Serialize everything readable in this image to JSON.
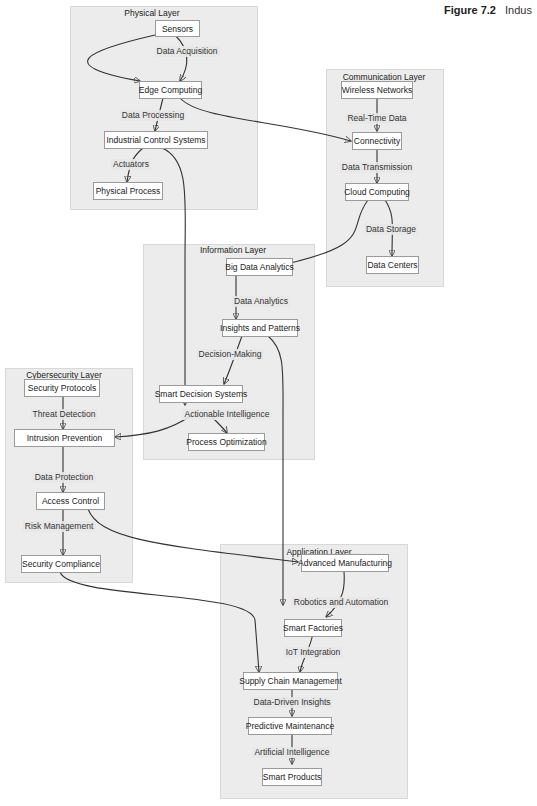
{
  "caption": {
    "figure": "Figure 7.2",
    "title": "Indus"
  },
  "clusters": {
    "physical": {
      "title": "Physical Layer"
    },
    "communication": {
      "title": "Communication Layer"
    },
    "information": {
      "title": "Information Layer"
    },
    "cybersecurity": {
      "title": "Cybersecurity Layer"
    },
    "application": {
      "title": "Application Layer"
    }
  },
  "nodes": {
    "sensors": "Sensors",
    "edge_computing": "Edge Computing",
    "industrial_control": "Industrial Control Systems",
    "physical_process": "Physical Process",
    "wireless_networks": "Wireless Networks",
    "connectivity": "Connectivity",
    "cloud_computing": "Cloud Computing",
    "data_centers": "Data Centers",
    "big_data": "Big Data Analytics",
    "insights": "Insights and Patterns",
    "smart_decision": "Smart Decision Systems",
    "process_optimization": "Process Optimization",
    "security_protocols": "Security Protocols",
    "intrusion_prevention": "Intrusion Prevention",
    "access_control": "Access Control",
    "security_compliance": "Security Compliance",
    "advanced_manufacturing": "Advanced Manufacturing",
    "smart_factories": "Smart Factories",
    "supply_chain": "Supply Chain Management",
    "predictive_maintenance": "Predictive Maintenance",
    "smart_products": "Smart Products"
  },
  "edge_labels": {
    "data_acquisition": "Data Acquisition",
    "data_processing": "Data Processing",
    "actuators": "Actuators",
    "real_time_data": "Real-Time Data",
    "data_transmission": "Data Transmission",
    "data_storage": "Data Storage",
    "data_analytics": "Data Analytics",
    "decision_making": "Decision-Making",
    "actionable_intelligence": "Actionable Intelligence",
    "threat_detection": "Threat Detection",
    "data_protection": "Data Protection",
    "risk_management": "Risk Management",
    "robotics_automation": "Robotics and Automation",
    "iot_integration": "IoT Integration",
    "data_driven_insights": "Data-Driven Insights",
    "artificial_intelligence": "Artificial Intelligence"
  },
  "edges": [
    [
      "Sensors",
      "Edge Computing",
      ""
    ],
    [
      "Sensors",
      "Edge Computing",
      "Data Acquisition"
    ],
    [
      "Edge Computing",
      "Industrial Control Systems",
      "Data Processing"
    ],
    [
      "Edge Computing",
      "Connectivity",
      ""
    ],
    [
      "Industrial Control Systems",
      "Physical Process",
      "Actuators"
    ],
    [
      "Industrial Control Systems",
      "Smart Decision Systems",
      ""
    ],
    [
      "Wireless Networks",
      "Connectivity",
      "Real-Time Data"
    ],
    [
      "Connectivity",
      "Cloud Computing",
      "Data Transmission"
    ],
    [
      "Cloud Computing",
      "Data Centers",
      "Data Storage"
    ],
    [
      "Cloud Computing",
      "Big Data Analytics",
      ""
    ],
    [
      "Big Data Analytics",
      "Insights and Patterns",
      "Data Analytics"
    ],
    [
      "Insights and Patterns",
      "Smart Decision Systems",
      "Decision-Making"
    ],
    [
      "Insights and Patterns",
      "Smart Factories",
      ""
    ],
    [
      "Smart Decision Systems",
      "Process Optimization",
      "Actionable Intelligence"
    ],
    [
      "Smart Decision Systems",
      "Intrusion Prevention",
      ""
    ],
    [
      "Security Protocols",
      "Intrusion Prevention",
      "Threat Detection"
    ],
    [
      "Intrusion Prevention",
      "Access Control",
      "Data Protection"
    ],
    [
      "Access Control",
      "Security Compliance",
      "Risk Management"
    ],
    [
      "Access Control",
      "Advanced Manufacturing",
      ""
    ],
    [
      "Security Compliance",
      "Supply Chain Management",
      ""
    ],
    [
      "Advanced Manufacturing",
      "Smart Factories",
      "Robotics and Automation"
    ],
    [
      "Smart Factories",
      "Supply Chain Management",
      "IoT Integration"
    ],
    [
      "Supply Chain Management",
      "Predictive Maintenance",
      "Data-Driven Insights"
    ],
    [
      "Predictive Maintenance",
      "Smart Products",
      "Artificial Intelligence"
    ]
  ]
}
